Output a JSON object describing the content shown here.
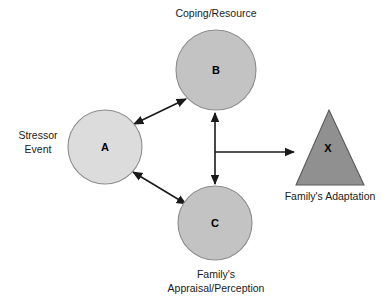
{
  "diagram": {
    "type": "abcx-family-stress-model",
    "background_color": "#ffffff",
    "nodes": [
      {
        "id": "a",
        "letter": "A",
        "shape": "circle",
        "caption_lines": [
          "Stressor",
          "Event"
        ],
        "caption_position": "left",
        "fill": "#dcdcdc",
        "stroke": "#8c8c8c",
        "cx": 105,
        "cy": 147,
        "r": 37
      },
      {
        "id": "b",
        "letter": "B",
        "shape": "circle",
        "caption_lines": [
          "Coping/Resource"
        ],
        "caption_position": "top",
        "fill": "#c3c3c3",
        "stroke": "#8c8c8c",
        "cx": 216,
        "cy": 70,
        "r": 40
      },
      {
        "id": "c",
        "letter": "C",
        "shape": "circle",
        "caption_lines": [
          "Family's",
          "Appraisal/Perception"
        ],
        "caption_position": "bottom",
        "fill": "#c3c3c3",
        "stroke": "#8c8c8c",
        "cx": 215,
        "cy": 223,
        "r": 37
      },
      {
        "id": "x",
        "letter": "X",
        "shape": "triangle",
        "caption_lines": [
          "Family's Adaptation"
        ],
        "caption_position": "bottom",
        "fill": "#909090",
        "stroke": "#5a5a5a",
        "apex_x": 329,
        "apex_y": 110,
        "base_y": 185,
        "base_left_x": 296,
        "base_right_x": 364
      }
    ],
    "edges": [
      {
        "id": "a-b",
        "from": "a",
        "to": "b",
        "arrowheads": "both",
        "style": "straight"
      },
      {
        "id": "a-c",
        "from": "a",
        "to": "c",
        "arrowheads": "both",
        "style": "straight"
      },
      {
        "id": "b-c",
        "from": "b",
        "to": "c",
        "arrowheads": "both",
        "style": "vertical"
      },
      {
        "id": "bc-x",
        "from": "b-c-midpoint",
        "to": "x",
        "arrowheads": "end",
        "style": "horizontal"
      }
    ],
    "line_color": "#1a1a1a"
  },
  "labels": {
    "a_letter": "A",
    "b_letter": "B",
    "c_letter": "C",
    "x_letter": "X",
    "stressor_line1": "Stressor",
    "stressor_line2": "Event",
    "coping_resource": "Coping/Resource",
    "appraisal_line1": "Family's",
    "appraisal_line2": "Appraisal/Perception",
    "adaptation": "Family's Adaptation"
  }
}
